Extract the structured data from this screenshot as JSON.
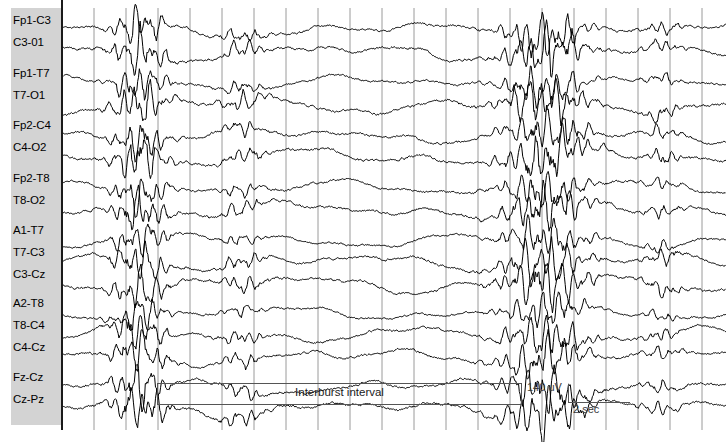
{
  "figure": {
    "kind": "eeg-recording",
    "width": 726,
    "height": 442,
    "background": "#ffffff",
    "label_panel_color": "#d3d3d3",
    "trace_color": "#000000",
    "grid_color": "#9a9a9a",
    "annotation_color": "#555555"
  },
  "annotations": {
    "interburst_label": "Interburst interval",
    "amplitude_scale": "140 uV",
    "time_scale": "2 sec"
  },
  "chart_data": {
    "type": "line",
    "title": "",
    "subtitle": "",
    "xlabel": "",
    "ylabel": "",
    "grid": true,
    "legend_position": "none",
    "x_axis": {
      "unit": "seconds",
      "gridline_spacing_px": 32.0,
      "gridline_seconds": 1.0,
      "scale_bar_seconds": 2,
      "first_gridline_px": 0,
      "gridline_count": 21
    },
    "y_axis": {
      "unit": "microvolts",
      "scale_bar_microvolts": 140
    },
    "annotations": [
      {
        "type": "span-box",
        "label": "Interburst interval",
        "x_start_px": 95,
        "x_end_px": 460
      },
      {
        "type": "scale-bar",
        "label_time": "2 sec",
        "label_amplitude": "140 uV",
        "x_px": 506
      }
    ],
    "groups": [
      {
        "name": "left-parasagittal",
        "channels": [
          {
            "label": "Fp1-C3",
            "y": 30,
            "amp": 5.5,
            "seed": 11
          },
          {
            "label": "C3-01",
            "y": 52,
            "amp": 6.0,
            "seed": 23
          }
        ]
      },
      {
        "name": "left-temporal",
        "channels": [
          {
            "label": "Fp1-T7",
            "y": 83,
            "amp": 5.0,
            "seed": 37
          },
          {
            "label": "T7-O1",
            "y": 105,
            "amp": 6.2,
            "seed": 41
          }
        ]
      },
      {
        "name": "right-parasagittal",
        "channels": [
          {
            "label": "Fp2-C4",
            "y": 135,
            "amp": 5.6,
            "seed": 59
          },
          {
            "label": "C4-O2",
            "y": 157,
            "amp": 6.4,
            "seed": 67
          }
        ]
      },
      {
        "name": "right-temporal",
        "channels": [
          {
            "label": "Fp2-T8",
            "y": 188,
            "amp": 5.2,
            "seed": 79
          },
          {
            "label": "T8-O2",
            "y": 210,
            "amp": 6.0,
            "seed": 83
          }
        ]
      },
      {
        "name": "left-transverse",
        "channels": [
          {
            "label": "A1-T7",
            "y": 240,
            "amp": 4.8,
            "seed": 97
          },
          {
            "label": "T7-C3",
            "y": 262,
            "amp": 5.8,
            "seed": 103
          },
          {
            "label": "C3-Cz",
            "y": 284,
            "amp": 6.2,
            "seed": 109
          }
        ]
      },
      {
        "name": "right-transverse",
        "channels": [
          {
            "label": "A2-T8",
            "y": 313,
            "amp": 4.6,
            "seed": 127
          },
          {
            "label": "T8-C4",
            "y": 335,
            "amp": 5.4,
            "seed": 131
          },
          {
            "label": "C4-Cz",
            "y": 357,
            "amp": 5.9,
            "seed": 137
          }
        ]
      },
      {
        "name": "midline",
        "channels": [
          {
            "label": "Fz-Cz",
            "y": 387,
            "amp": 6.0,
            "seed": 149
          },
          {
            "label": "Cz-Pz",
            "y": 409,
            "amp": 6.6,
            "seed": 157
          }
        ]
      }
    ],
    "bursts": [
      {
        "name": "burst-1",
        "center_px": 78,
        "half_width_px": 30,
        "gain": 4.2
      },
      {
        "name": "burst-2",
        "center_px": 180,
        "half_width_px": 26,
        "gain": 1.5
      },
      {
        "name": "burst-3",
        "center_px": 483,
        "half_width_px": 46,
        "gain": 4.6
      },
      {
        "name": "burst-4",
        "center_px": 600,
        "half_width_px": 22,
        "gain": 1.4
      }
    ],
    "label_y_offsets": [
      {
        "label": "Fp1-C3",
        "text_y": 14
      },
      {
        "label": "C3-01",
        "text_y": 36
      },
      {
        "label": "Fp1-T7",
        "text_y": 67
      },
      {
        "label": "T7-O1",
        "text_y": 89
      },
      {
        "label": "Fp2-C4",
        "text_y": 119
      },
      {
        "label": "C4-O2",
        "text_y": 141
      },
      {
        "label": "Fp2-T8",
        "text_y": 172
      },
      {
        "label": "T8-O2",
        "text_y": 194
      },
      {
        "label": "A1-T7",
        "text_y": 224
      },
      {
        "label": "T7-C3",
        "text_y": 246
      },
      {
        "label": "C3-Cz",
        "text_y": 268
      },
      {
        "label": "A2-T8",
        "text_y": 297
      },
      {
        "label": "T8-C4",
        "text_y": 319
      },
      {
        "label": "C4-Cz",
        "text_y": 341
      },
      {
        "label": "Fz-Cz",
        "text_y": 371
      },
      {
        "label": "Cz-Pz",
        "text_y": 393
      }
    ]
  }
}
